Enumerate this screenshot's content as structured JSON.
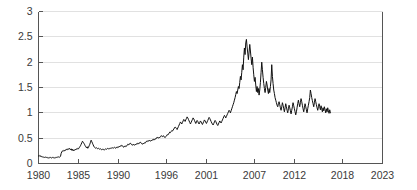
{
  "chart_data": {
    "type": "line",
    "title": "",
    "subtitle": "",
    "xlabel": "",
    "ylabel": "",
    "xlim": [
      1980,
      2023
    ],
    "ylim": [
      0,
      3
    ],
    "grid": true,
    "legend": "none",
    "x_ticks": [
      "1980",
      "1985",
      "1990",
      "1996",
      "2001",
      "2007",
      "2012",
      "2018",
      "2023"
    ],
    "x_tick_values": [
      1980,
      1985,
      1990,
      1996,
      2001,
      2007,
      2012,
      2018,
      2023
    ],
    "y_ticks": [
      "0",
      "0.5",
      "1",
      "1.5",
      "2",
      "2.5",
      "3"
    ],
    "y_tick_values": [
      0,
      0.5,
      1,
      1.5,
      2,
      2.5,
      3
    ],
    "line_color": "#111111",
    "grid_color": "#d9d9d9",
    "axis_color": "#555555",
    "series": [
      {
        "name": "series-1",
        "x_start": 1980.0,
        "x_step": 0.0833,
        "values": [
          0.15,
          0.14,
          0.16,
          0.15,
          0.13,
          0.14,
          0.13,
          0.12,
          0.13,
          0.12,
          0.13,
          0.12,
          0.12,
          0.11,
          0.12,
          0.11,
          0.12,
          0.11,
          0.12,
          0.11,
          0.11,
          0.12,
          0.11,
          0.12,
          0.11,
          0.12,
          0.11,
          0.12,
          0.13,
          0.12,
          0.13,
          0.12,
          0.13,
          0.14,
          0.2,
          0.23,
          0.25,
          0.24,
          0.26,
          0.25,
          0.27,
          0.26,
          0.28,
          0.27,
          0.29,
          0.28,
          0.3,
          0.29,
          0.27,
          0.29,
          0.26,
          0.28,
          0.25,
          0.27,
          0.26,
          0.28,
          0.27,
          0.29,
          0.28,
          0.3,
          0.29,
          0.31,
          0.33,
          0.35,
          0.38,
          0.41,
          0.44,
          0.42,
          0.4,
          0.38,
          0.35,
          0.33,
          0.31,
          0.33,
          0.3,
          0.32,
          0.35,
          0.38,
          0.42,
          0.46,
          0.43,
          0.4,
          0.37,
          0.34,
          0.32,
          0.31,
          0.3,
          0.31,
          0.3,
          0.29,
          0.3,
          0.29,
          0.28,
          0.29,
          0.28,
          0.27,
          0.28,
          0.27,
          0.28,
          0.27,
          0.28,
          0.29,
          0.28,
          0.29,
          0.3,
          0.29,
          0.3,
          0.29,
          0.3,
          0.31,
          0.3,
          0.31,
          0.3,
          0.31,
          0.32,
          0.31,
          0.3,
          0.32,
          0.31,
          0.33,
          0.32,
          0.34,
          0.33,
          0.35,
          0.34,
          0.36,
          0.35,
          0.33,
          0.32,
          0.34,
          0.33,
          0.35,
          0.34,
          0.36,
          0.38,
          0.37,
          0.39,
          0.38,
          0.4,
          0.39,
          0.37,
          0.36,
          0.38,
          0.37,
          0.36,
          0.38,
          0.37,
          0.39,
          0.38,
          0.4,
          0.39,
          0.41,
          0.4,
          0.42,
          0.41,
          0.39,
          0.38,
          0.4,
          0.39,
          0.41,
          0.4,
          0.42,
          0.44,
          0.43,
          0.45,
          0.44,
          0.46,
          0.45,
          0.44,
          0.46,
          0.45,
          0.47,
          0.46,
          0.48,
          0.47,
          0.49,
          0.48,
          0.5,
          0.52,
          0.51,
          0.5,
          0.52,
          0.51,
          0.53,
          0.55,
          0.54,
          0.53,
          0.55,
          0.54,
          0.52,
          0.51,
          0.53,
          0.55,
          0.57,
          0.56,
          0.58,
          0.6,
          0.62,
          0.61,
          0.63,
          0.65,
          0.64,
          0.66,
          0.68,
          0.7,
          0.72,
          0.71,
          0.69,
          0.67,
          0.7,
          0.73,
          0.76,
          0.79,
          0.82,
          0.8,
          0.78,
          0.81,
          0.84,
          0.87,
          0.85,
          0.83,
          0.86,
          0.89,
          0.92,
          0.9,
          0.87,
          0.84,
          0.81,
          0.78,
          0.81,
          0.84,
          0.87,
          0.9,
          0.88,
          0.85,
          0.82,
          0.79,
          0.82,
          0.85,
          0.83,
          0.8,
          0.78,
          0.81,
          0.84,
          0.82,
          0.79,
          0.77,
          0.8,
          0.83,
          0.86,
          0.84,
          0.81,
          0.79,
          0.82,
          0.85,
          0.88,
          0.91,
          0.89,
          0.86,
          0.83,
          0.8,
          0.78,
          0.76,
          0.79,
          0.82,
          0.85,
          0.83,
          0.8,
          0.77,
          0.75,
          0.78,
          0.81,
          0.84,
          0.82,
          0.8,
          0.83,
          0.86,
          0.89,
          0.92,
          0.95,
          0.93,
          0.9,
          0.93,
          0.96,
          0.99,
          1.02,
          1.05,
          1.03,
          1.0,
          1.04,
          1.08,
          1.12,
          1.16,
          1.2,
          1.25,
          1.3,
          1.36,
          1.42,
          1.38,
          1.45,
          1.52,
          1.48,
          1.6,
          1.72,
          1.65,
          1.8,
          1.95,
          1.85,
          2.1,
          2.28,
          2.15,
          2.38,
          2.45,
          2.3,
          2.18,
          2.05,
          2.2,
          2.35,
          2.22,
          2.08,
          1.95,
          2.1,
          1.9,
          1.75,
          1.62,
          1.7,
          1.55,
          1.42,
          1.52,
          1.4,
          1.48,
          1.35,
          1.45,
          1.6,
          1.8,
          2.0,
          1.85,
          1.7,
          1.58,
          1.48,
          1.4,
          1.5,
          1.62,
          1.55,
          1.45,
          1.38,
          1.48,
          1.4,
          1.52,
          1.65,
          1.95,
          1.72,
          1.58,
          1.45,
          1.38,
          1.3,
          1.25,
          1.2,
          1.15,
          1.12,
          1.18,
          1.22,
          1.16,
          1.1,
          1.05,
          1.12,
          1.2,
          1.15,
          1.08,
          1.02,
          1.1,
          1.18,
          1.12,
          1.05,
          1.0,
          1.08,
          1.15,
          1.1,
          1.04,
          0.98,
          1.05,
          1.12,
          1.2,
          1.14,
          1.08,
          1.02,
          0.96,
          1.02,
          1.1,
          1.18,
          1.25,
          1.18,
          1.12,
          1.2,
          1.28,
          1.22,
          1.15,
          1.08,
          1.02,
          1.1,
          1.18,
          1.12,
          1.06,
          1.0,
          1.08,
          1.15,
          1.22,
          1.3,
          1.45,
          1.38,
          1.3,
          1.24,
          1.18,
          1.12,
          1.2,
          1.28,
          1.22,
          1.16,
          1.1,
          1.05,
          1.12,
          1.18,
          1.12,
          1.06,
          1.14,
          1.08,
          1.02,
          1.1,
          1.04,
          1.12,
          1.06,
          1.0,
          1.08,
          1.02,
          1.1,
          1.04,
          0.99,
          1.06,
          1.0
        ]
      }
    ]
  }
}
